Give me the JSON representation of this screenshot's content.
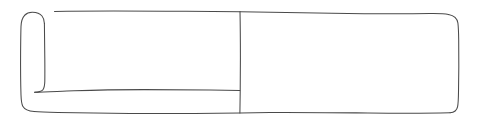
{
  "canvas": {
    "width": 480,
    "height": 128,
    "background_color": "#ffffff",
    "style": "hand-drawn-wireframe-sketch"
  },
  "stroke": {
    "color": "#4a4a4a",
    "width_px": 1,
    "quality": "hand-drawn wobbly single stroke"
  },
  "outer_frame": {
    "name": "rounded-rectangle-container",
    "left_px": 20,
    "top_px": 11,
    "right_px": 459,
    "bottom_px": 113,
    "corner_radius_px": 9,
    "fill": "#ffffff",
    "note": "Outer rounded rectangle spanning nearly the full canvas width."
  },
  "left_panel": {
    "name": "left-panel",
    "left_px": 20,
    "right_px": 240,
    "top_px": 11,
    "bottom_px": 113,
    "fill": "#ffffff"
  },
  "right_panel": {
    "name": "right-panel",
    "left_px": 240,
    "right_px": 459,
    "top_px": 11,
    "bottom_px": 113,
    "fill": "#ffffff"
  },
  "vertical_divider": {
    "name": "panel-divider",
    "x_px": 240,
    "y_start_px": 11,
    "y_end_px": 113,
    "orientation": "vertical"
  },
  "sidebar_strip": {
    "name": "left-sidebar-strip",
    "left_px": 20,
    "right_px": 45,
    "top_px": 13,
    "bottom_px": 113,
    "note": "Narrow vertical column at the far left; its inner edge sweeps down and bends right near the bottom."
  },
  "bottom_divider": {
    "name": "left-panel-bottom-divider",
    "x_start_px": 45,
    "x_end_px": 240,
    "y_px": 90,
    "orientation": "horizontal",
    "note": "Slightly wavy horizontal rule inside the left panel, near its lower edge."
  },
  "top_edge": {
    "name": "top-edge-line",
    "x_start_px": 54,
    "x_end_px": 450,
    "y_px": 12,
    "note": "Top border line begins just right of the sidebar arc and runs to the top-right rounded corner."
  },
  "content": {
    "text_elements": [],
    "note": "No text, labels, icons or data values are rendered anywhere in this sketch; all regions are blank white."
  }
}
